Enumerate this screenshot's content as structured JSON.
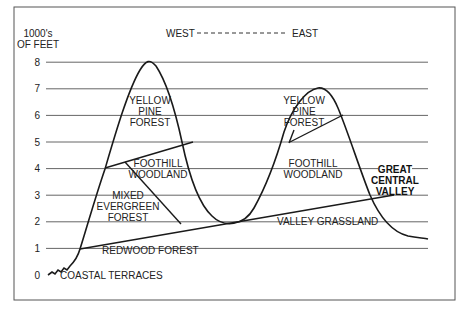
{
  "axis": {
    "unit_line1": "1000's",
    "unit_line2": "OF FEET",
    "ticks": [
      "0",
      "1",
      "2",
      "3",
      "4",
      "5",
      "6",
      "7",
      "8"
    ]
  },
  "direction": {
    "west": "WEST",
    "dashes": "- - - - - - - - - - - - - - -",
    "east": "EAST"
  },
  "zones": {
    "yellow_pine_west": [
      "YELLOW",
      "PINE",
      "FOREST"
    ],
    "yellow_pine_east": [
      "YELLOW",
      "PINE",
      "FOREST"
    ],
    "foothill_west": [
      "FOOTHILL",
      "WOODLAND"
    ],
    "foothill_east": [
      "FOOTHILL",
      "WOODLAND"
    ],
    "mixed_evergreen": [
      "MIXED",
      "EVERGREEN",
      "FOREST"
    ],
    "redwood": "REDWOOD FOREST",
    "valley_grassland": "VALLEY GRASSLAND",
    "coastal_terraces": "COASTAL TERRACES",
    "great_central_valley": [
      "GREAT",
      "CENTRAL",
      "VALLEY"
    ]
  },
  "colors": {
    "line": "#1a1a1a",
    "grid": "#555555",
    "frame": "#555555"
  }
}
